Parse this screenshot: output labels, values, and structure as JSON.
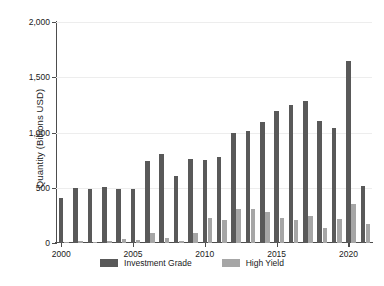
{
  "chart_data": {
    "type": "bar",
    "title": "",
    "xlabel": "",
    "ylabel": "Quantity (Billions USD)",
    "categories": [
      "2000",
      "2001",
      "2002",
      "2003",
      "2004",
      "2005",
      "2006",
      "2007",
      "2008",
      "2009",
      "2010",
      "2011",
      "2012",
      "2013",
      "2014",
      "2015",
      "2016",
      "2017",
      "2018",
      "2019",
      "2020",
      "2021"
    ],
    "series": [
      {
        "name": "Investment Grade",
        "color": "#595959",
        "values": [
          410,
          495,
          485,
          505,
          490,
          490,
          745,
          805,
          610,
          760,
          750,
          775,
          1000,
          1015,
          1095,
          1195,
          1250,
          1285,
          1100,
          1040,
          1650,
          520
        ]
      },
      {
        "name": "High Yield",
        "color": "#a6a6a6",
        "values": [
          5,
          15,
          8,
          22,
          38,
          28,
          92,
          48,
          18,
          90,
          230,
          205,
          310,
          305,
          285,
          230,
          210,
          245,
          140,
          220,
          350,
          175
        ]
      }
    ],
    "ylim": [
      0,
      2000
    ],
    "yticks": [
      0,
      500,
      1000,
      1500,
      2000
    ],
    "ytick_labels": [
      "0",
      "500",
      "1,000",
      "1,500",
      "2,000"
    ],
    "xticks": [
      "2000",
      "2005",
      "2010",
      "2015",
      "2020"
    ],
    "grid": "horizontal",
    "legend_position": "bottom-center"
  },
  "legend": {
    "entries": [
      {
        "label": "Investment Grade",
        "color": "#595959"
      },
      {
        "label": "High Yield",
        "color": "#a6a6a6"
      }
    ]
  },
  "axes": {
    "y_title": "Quantity (Billions USD)"
  }
}
